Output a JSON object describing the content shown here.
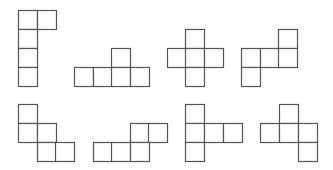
{
  "diagram": {
    "title": "",
    "square_size": 19,
    "line_color": "#555555",
    "background": "#ffffff",
    "shapes": [
      {
        "id": "net-1",
        "cells": [
          [
            18,
            10
          ],
          [
            37,
            10
          ],
          [
            18,
            29
          ],
          [
            18,
            48
          ],
          [
            18,
            67
          ]
        ]
      },
      {
        "id": "net-2",
        "cells": [
          [
            111,
            48
          ],
          [
            74,
            67
          ],
          [
            93,
            67
          ],
          [
            111,
            67
          ],
          [
            130,
            67
          ]
        ]
      },
      {
        "id": "net-3",
        "cells": [
          [
            185,
            29
          ],
          [
            167,
            48
          ],
          [
            185,
            48
          ],
          [
            204,
            48
          ],
          [
            185,
            67
          ]
        ]
      },
      {
        "id": "net-4",
        "cells": [
          [
            278,
            29
          ],
          [
            241,
            48
          ],
          [
            260,
            48
          ],
          [
            278,
            48
          ],
          [
            241,
            67
          ]
        ]
      },
      {
        "id": "net-5",
        "cells": [
          [
            18,
            104
          ],
          [
            18,
            123
          ],
          [
            37,
            123
          ],
          [
            37,
            142
          ],
          [
            55,
            142
          ]
        ]
      },
      {
        "id": "net-6",
        "cells": [
          [
            130,
            123
          ],
          [
            148,
            123
          ],
          [
            93,
            142
          ],
          [
            111,
            142
          ],
          [
            130,
            142
          ]
        ]
      },
      {
        "id": "net-7",
        "cells": [
          [
            185,
            104
          ],
          [
            185,
            123
          ],
          [
            204,
            123
          ],
          [
            223,
            123
          ],
          [
            185,
            142
          ]
        ]
      },
      {
        "id": "net-8",
        "cells": [
          [
            279,
            104
          ],
          [
            260,
            123
          ],
          [
            279,
            123
          ],
          [
            298,
            123
          ],
          [
            298,
            142
          ]
        ]
      }
    ]
  }
}
